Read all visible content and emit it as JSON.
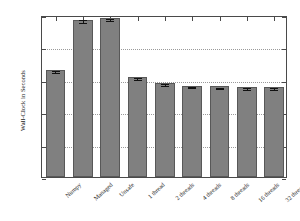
{
  "chart_data": {
    "type": "bar",
    "title": "",
    "xlabel": "",
    "ylabel": "Wall-Clock in Seconds",
    "ylim": [
      0,
      250
    ],
    "yticks": [
      0,
      50,
      100,
      150,
      200,
      250
    ],
    "ytick_labels": [
      "0",
      "50",
      "100",
      "150",
      "200",
      "250"
    ],
    "grid": "horizontal-dotted",
    "legend": "none",
    "bar_color": "#808080",
    "bar_edge_color": "#585858",
    "categories": [
      "Numpy",
      "Managed",
      "Unsafe",
      "1 thread",
      "2 threads",
      "4 threads",
      "8 threads",
      "16 threads",
      "32 threads"
    ],
    "values": [
      165,
      243,
      245,
      154,
      145,
      141,
      140,
      139,
      139
    ],
    "errors": [
      1.5,
      2.0,
      1.5,
      1.5,
      1.0,
      1.0,
      1.0,
      1.0,
      1.0
    ],
    "has_error_bars": true
  },
  "axes": {
    "y_title": "Wall-Clock in Seconds"
  }
}
